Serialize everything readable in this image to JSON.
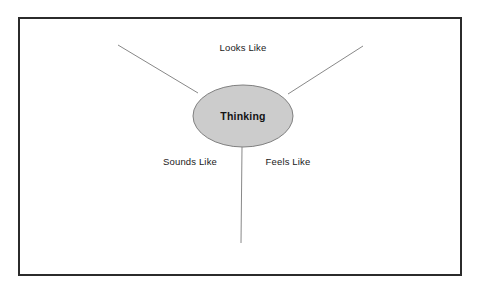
{
  "diagram": {
    "type": "three-spoke-bubble-map",
    "frame": {
      "border_color": "#2b2b2b",
      "background": "#ffffff"
    },
    "center": {
      "shape": "ellipse",
      "label": "Thinking",
      "fill_color": "#cccccc",
      "stroke_color": "#808080",
      "cx": 243,
      "cy": 116,
      "rx": 50,
      "ry": 31
    },
    "spokes": [
      {
        "name": "looks-like",
        "label": "Looks Like",
        "direction": "upper-left",
        "line": {
          "x1": 118,
          "y1": 45,
          "x2": 198,
          "y2": 93
        },
        "label_x": 243,
        "label_y": 48
      },
      {
        "name": "feels-like",
        "label": "Feels Like",
        "direction": "upper-right",
        "line": {
          "x1": 363,
          "y1": 46,
          "x2": 288,
          "y2": 94
        },
        "label_x": 288,
        "label_y": 162
      },
      {
        "name": "sounds-like",
        "label": "Sounds Like",
        "direction": "down",
        "line": {
          "x1": 242,
          "y1": 147,
          "x2": 241,
          "y2": 243
        },
        "label_x": 190,
        "label_y": 162
      }
    ],
    "line_color": "#7a7a7a",
    "line_width": 0.9
  }
}
